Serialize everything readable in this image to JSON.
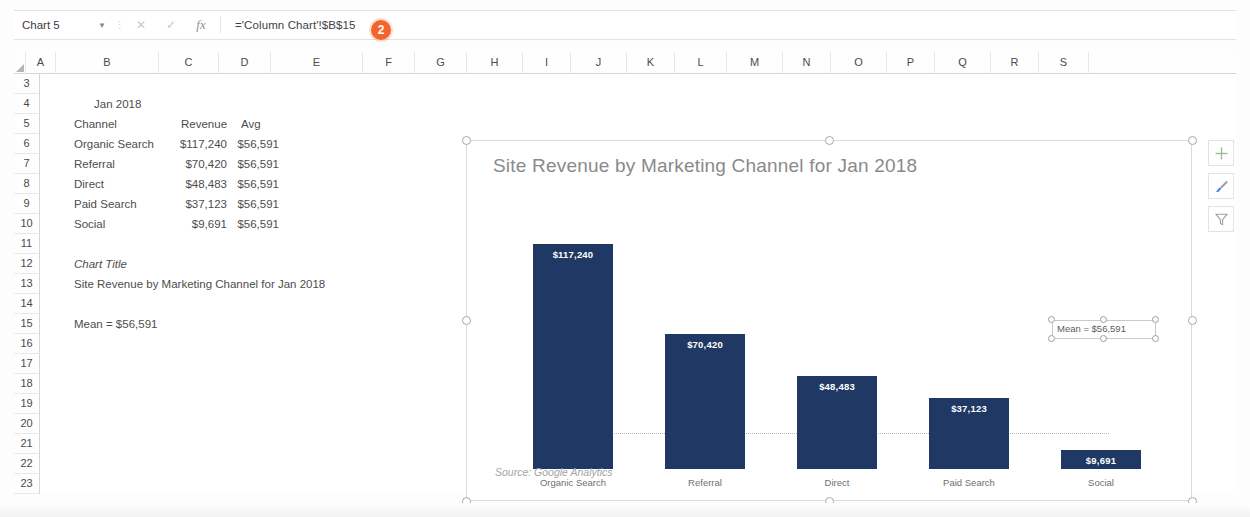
{
  "app": "Microsoft Excel",
  "formula_bar": {
    "name_box": "Chart 5",
    "dropdown_icon": "chevron-down-icon",
    "cancel_icon": "cancel-icon",
    "enter_icon": "enter-icon",
    "fx_icon": "fx-icon",
    "formula": "='Column Chart'!$B$15"
  },
  "callouts": [
    {
      "id": "1",
      "label": "1"
    },
    {
      "id": "2",
      "label": "2"
    },
    {
      "id": "3",
      "label": "3"
    }
  ],
  "grid": {
    "columns": [
      "A",
      "B",
      "C",
      "D",
      "E",
      "F",
      "G",
      "H",
      "I",
      "J",
      "K",
      "L",
      "M",
      "N",
      "O",
      "P",
      "Q",
      "R",
      "S"
    ],
    "column_widths": [
      30,
      103,
      60,
      52,
      92,
      52,
      52,
      56,
      48,
      56,
      48,
      52,
      56,
      48,
      56,
      48,
      56,
      48,
      50
    ],
    "rows": [
      "3",
      "4",
      "5",
      "6",
      "7",
      "8",
      "9",
      "10",
      "11",
      "12",
      "13",
      "14",
      "15",
      "16",
      "17",
      "18",
      "19",
      "20",
      "21",
      "22",
      "23"
    ]
  },
  "sheet_cells": {
    "b4": "Jan 2018",
    "header_channel": "Channel",
    "header_revenue": "Revenue",
    "header_avg": "Avg",
    "table_rows": [
      {
        "channel": "Organic Search",
        "revenue": "$117,240",
        "avg": "$56,591"
      },
      {
        "channel": "Referral",
        "revenue": "$70,420",
        "avg": "$56,591"
      },
      {
        "channel": "Direct",
        "revenue": "$48,483",
        "avg": "$56,591"
      },
      {
        "channel": "Paid Search",
        "revenue": "$37,123",
        "avg": "$56,591"
      },
      {
        "channel": "Social",
        "revenue": "$9,691",
        "avg": "$56,591"
      }
    ],
    "chart_title_label": "Chart Title",
    "chart_title_value": "Site Revenue by Marketing Channel for Jan 2018",
    "mean_cell": "Mean = $56,591"
  },
  "chart": {
    "title": "Site Revenue by Marketing Channel for Jan 2018",
    "source_note": "Source: Google Analytics",
    "textbox": "Mean = $56,591",
    "selected": true,
    "tools": [
      {
        "name": "chart-elements-button",
        "icon": "plus-icon"
      },
      {
        "name": "chart-styles-button",
        "icon": "paintbrush-icon"
      },
      {
        "name": "chart-filters-button",
        "icon": "funnel-icon"
      }
    ]
  },
  "chart_data": {
    "type": "bar",
    "title": "Site Revenue by Marketing Channel for Jan 2018",
    "xlabel": "",
    "ylabel": "",
    "categories": [
      "Organic Search",
      "Referral",
      "Direct",
      "Paid Search",
      "Social"
    ],
    "values": [
      117240,
      70420,
      48483,
      37123,
      9691
    ],
    "value_labels": [
      "$117,240",
      "$70,420",
      "$48,483",
      "$37,123",
      "$9,691"
    ],
    "mean": 56591,
    "mean_label": "Mean = $56,591",
    "series": [
      {
        "name": "Revenue",
        "values": [
          117240,
          70420,
          48483,
          37123,
          9691
        ],
        "color": "#1F3864"
      }
    ],
    "ylim": [
      0,
      130000
    ],
    "grid": false,
    "legend": "none",
    "annotations": [
      "Source: Google Analytics",
      "Mean = $56,591"
    ],
    "bar_color": "#1F3864",
    "label_color": "#FFFFFF"
  },
  "colors": {
    "accent_badge": "#F4632B",
    "bar_navy": "#1F3864",
    "title_gray": "#8A8A8A",
    "text_gray": "#4D4D4D"
  }
}
